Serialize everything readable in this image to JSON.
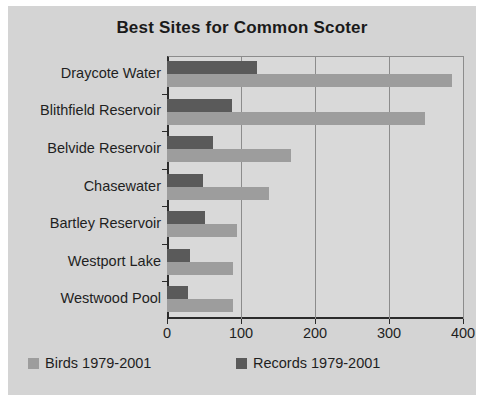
{
  "chart_data": {
    "type": "bar",
    "orientation": "horizontal",
    "title": "Best Sites for Common Scoter",
    "xlabel": "",
    "ylabel": "",
    "xlim": [
      0,
      400
    ],
    "xticks": [
      "0",
      "100",
      "200",
      "300",
      "400"
    ],
    "grid": true,
    "legend_position": "bottom",
    "categories": [
      "Draycote Water",
      "Blithfield Reservoir",
      "Belvide Reservoir",
      "Chasewater",
      "Bartley Reservoir",
      "Westport Lake",
      "Westwood Pool"
    ],
    "series": [
      {
        "name": "Birds 1979-2001",
        "color": "#9d9d9d",
        "values": [
          385,
          348,
          167,
          138,
          95,
          89,
          89
        ]
      },
      {
        "name": "Records 1979-2001",
        "color": "#5a5a5a",
        "values": [
          122,
          88,
          62,
          48,
          52,
          31,
          29
        ]
      }
    ]
  },
  "legend": {
    "items": [
      {
        "label": "Birds 1979-2001",
        "color": "#9d9d9d"
      },
      {
        "label": "Records 1979-2001",
        "color": "#5a5a5a"
      }
    ]
  }
}
